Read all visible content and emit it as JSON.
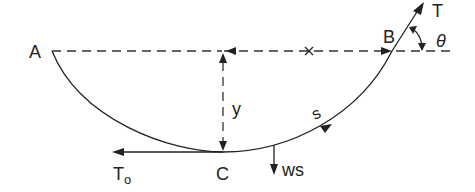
{
  "diagram": {
    "title": "",
    "labels": {
      "A": "A",
      "B": "B",
      "C": "C",
      "T": "T",
      "theta": "θ",
      "y": "y",
      "s": "s",
      "T0_main": "T",
      "T0_sub": "o",
      "ws": "ws"
    },
    "colors": {
      "stroke": "#222222",
      "background": "#ffffff"
    }
  }
}
